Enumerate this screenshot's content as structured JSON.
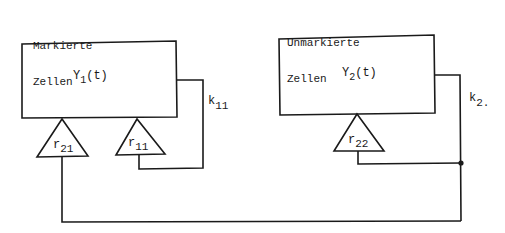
{
  "diagram": {
    "type": "compartment-feedback-diagram",
    "compartments": [
      {
        "id": "marked",
        "group_label_line1": "Markierte",
        "group_label_line2": "Zellen",
        "variable": "Y",
        "subscript": "1",
        "arg": "(t)"
      },
      {
        "id": "unmarked",
        "group_label_line1": "Unmarkierte",
        "group_label_line2": "Zellen",
        "variable": "Y",
        "subscript": "2",
        "arg": "(t)"
      }
    ],
    "rate_constants": [
      {
        "id": "k11",
        "base": "k",
        "subscript": "11"
      },
      {
        "id": "k2",
        "base": "k",
        "subscript": "2."
      }
    ],
    "amplifiers": [
      {
        "id": "r21",
        "base": "r",
        "subscript": "21"
      },
      {
        "id": "r11",
        "base": "r",
        "subscript": "11"
      },
      {
        "id": "r22",
        "base": "r",
        "subscript": "22"
      }
    ],
    "colors": {
      "stroke": "#1a1a1a",
      "background": "#ffffff"
    }
  }
}
